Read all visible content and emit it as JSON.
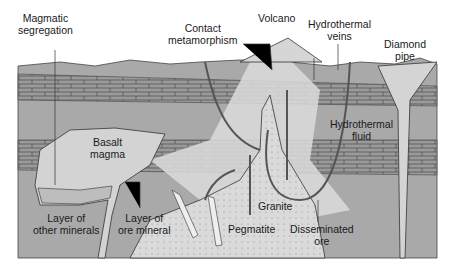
{
  "diagram": {
    "labels": {
      "magmatic_segregation": [
        "Magmatic",
        "segregation"
      ],
      "contact_metamorphism": [
        "Contact",
        "metamorphism"
      ],
      "volcano": "Volcano",
      "hydrothermal_veins": [
        "Hydrothermal",
        "veins"
      ],
      "diamond_pipe": [
        "Diamond",
        "pipe"
      ],
      "basalt_magma": [
        "Basalt",
        "magma"
      ],
      "hydrothermal_fluid": [
        "Hydrothermal",
        "fluid"
      ],
      "granite": "Granite",
      "pegmatite": "Pegmatite",
      "disseminated_ore": [
        "Disseminated",
        "ore"
      ],
      "layer_other_minerals": [
        "Layer of",
        "other minerals"
      ],
      "layer_ore_mineral": [
        "Layer of",
        "ore mineral"
      ]
    },
    "colors": {
      "background": "#ffffff",
      "ground": "#a9a9a9",
      "rock_layer": "#9c9c9c",
      "brick_line": "#4a4a4a",
      "magma": "#d2d2d2",
      "granite": "#c4c4c4",
      "halo": "#dcdcdc",
      "outline": "#333333"
    }
  }
}
